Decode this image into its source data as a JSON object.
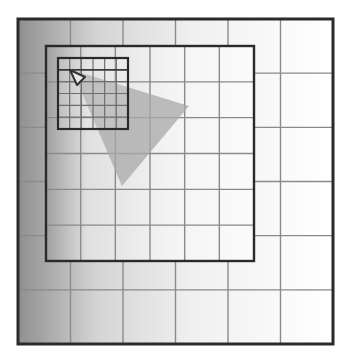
{
  "diagram": {
    "colors": {
      "background": "#ffffff",
      "gradient_dark": "#9a9a9a",
      "gradient_light": "#ffffff",
      "grid_line": "#8a8a8a",
      "frame_line": "#2a2a2a",
      "triangle_fill": "#a8a8a8",
      "triangle_outline": "#333333"
    },
    "outer_grid": {
      "x": 18,
      "y": 19,
      "w": 315,
      "h": 325,
      "cols": 6,
      "rows": 6
    },
    "middle_grid": {
      "x": 46,
      "y": 46,
      "w": 208,
      "h": 215,
      "cols": 6,
      "rows": 6
    },
    "inner_grid": {
      "x": 58,
      "y": 58,
      "w": 70,
      "h": 71,
      "cols": 6,
      "rows": 6
    },
    "large_triangle": {
      "points": [
        [
          72,
          70
        ],
        [
          189,
          106
        ],
        [
          122,
          186
        ]
      ]
    },
    "small_triangle": {
      "points": [
        [
          70,
          70
        ],
        [
          85,
          77
        ],
        [
          77,
          85
        ]
      ]
    }
  }
}
